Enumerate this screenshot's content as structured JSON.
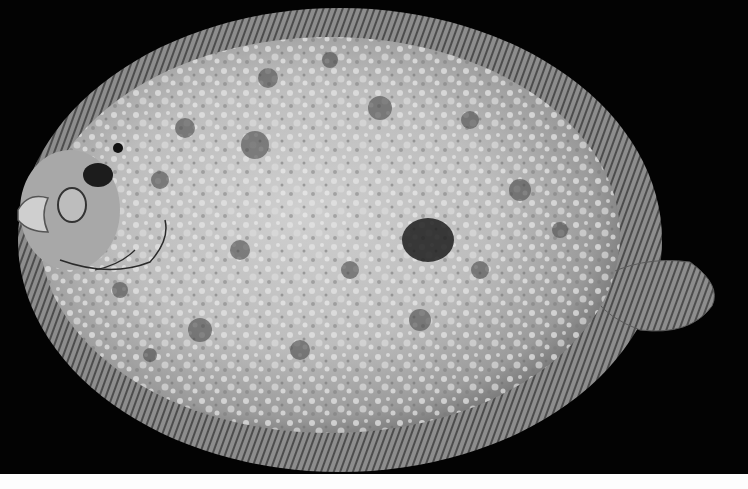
{
  "image": {
    "subject": "flatfish (sole/flounder), dorsal view, grayscale",
    "width": 748,
    "height": 489,
    "background_color": "#030303",
    "bottom_strip_color": "#fdfdfd",
    "body_light_color": "#d6d6d6",
    "body_mid_color": "#9c9c9c",
    "body_dark_color": "#3a3a3a",
    "fin_color": "#8a8a8a"
  }
}
